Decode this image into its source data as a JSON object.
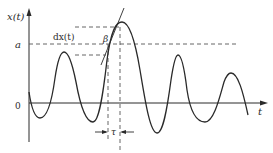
{
  "diagram": {
    "type": "random-process-level-crossing",
    "axes": {
      "y_label": "x(t)",
      "x_label": "t",
      "origin_label": "0",
      "level_label": "a"
    },
    "annotations": {
      "derivative_label": "dx(t)",
      "angle_label": "β",
      "interval_label": "τ"
    },
    "colors": {
      "curve": "#2a2a2a",
      "axis": "#2a2a2a",
      "dashed": "#555555",
      "background": "#ffffff"
    }
  }
}
